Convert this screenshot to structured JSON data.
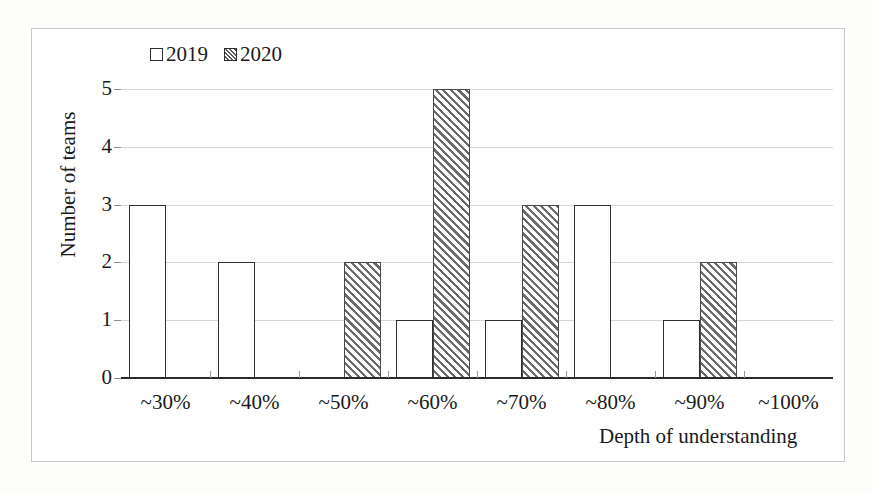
{
  "chart_data": {
    "type": "bar",
    "title": "",
    "xlabel": "Depth of understanding",
    "ylabel": "Number of teams",
    "categories": [
      "~30%",
      "~40%",
      "~50%",
      "~60%",
      "~70%",
      "~80%",
      "~90%",
      "~100%"
    ],
    "series": [
      {
        "name": "2019",
        "values": [
          3,
          2,
          0,
          1,
          1,
          3,
          1,
          0
        ]
      },
      {
        "name": "2020",
        "values": [
          0,
          0,
          2,
          5,
          3,
          0,
          2,
          0
        ]
      }
    ],
    "ylim": [
      0,
      5
    ],
    "yticks": [
      0,
      1,
      2,
      3,
      4,
      5
    ],
    "ytick_labels": [
      "0",
      "1",
      "2",
      "3",
      "4",
      "5"
    ],
    "grid": "horizontal",
    "legend_position": "top-left",
    "legend": [
      {
        "label": "2019",
        "fill": "empty"
      },
      {
        "label": "2020",
        "fill": "diagonal-hatch"
      }
    ],
    "colors": {
      "bar_outline": "#2f2f2f",
      "hatch": "#6b6b6b",
      "gridline": "#d6d6d6",
      "axis": "#2b2b2b",
      "frame": "#c9c9c9",
      "background": "#ffffff",
      "text": "#1a1a1a"
    }
  }
}
